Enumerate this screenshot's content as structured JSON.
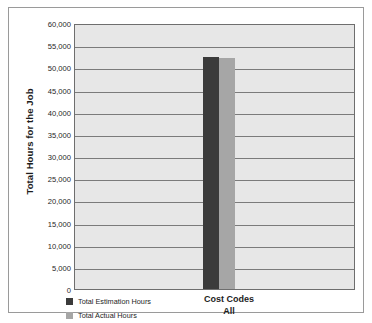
{
  "chart_data": {
    "type": "bar",
    "title": "",
    "xlabel": "Cost Codes",
    "xlabel_sub": "All",
    "ylabel": "Total Hours for the Job",
    "categories": [
      "All"
    ],
    "ylim": [
      0,
      60000
    ],
    "ytick_step": 5000,
    "grid": true,
    "legend_position": "bottom-left",
    "yticks": [
      "60,000",
      "55,000",
      "50,000",
      "45,000",
      "40,000",
      "35,000",
      "30,000",
      "25,000",
      "20,000",
      "15,000",
      "10,000",
      "5,000",
      "0"
    ],
    "ytick_values": [
      60000,
      55000,
      50000,
      45000,
      40000,
      35000,
      30000,
      25000,
      20000,
      15000,
      10000,
      5000,
      0
    ],
    "series": [
      {
        "name": "Total Estimation Hours",
        "values": [
          52400
        ],
        "color": "#3b3b3b"
      },
      {
        "name": "Total Actual Hours",
        "values": [
          52100
        ],
        "color": "#a6a6a6"
      }
    ]
  },
  "colors": {
    "plot_background": "#e7e7e7",
    "gridline": "#7b7b7b",
    "axis": "#6e6e6e",
    "frame": "#9a9a9a",
    "page_background": "#ffffff",
    "text": "#1d1d1d"
  }
}
